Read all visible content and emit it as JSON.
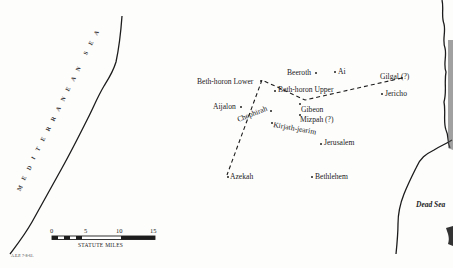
{
  "map": {
    "sea_label": "MEDITERRANEAN SEA",
    "dead_sea_label": "Dead Sea",
    "credit": "A.E.P. 7-8-61.",
    "places": [
      {
        "id": "beeroth",
        "name": "Beeroth"
      },
      {
        "id": "ai",
        "name": "Ai"
      },
      {
        "id": "beth-horon-lower",
        "name": "Beth-horon Lower"
      },
      {
        "id": "beth-horon-upper",
        "name": "Beth-horon Upper"
      },
      {
        "id": "gilgal",
        "name": "Gilgal (?)"
      },
      {
        "id": "jericho",
        "name": "Jericho"
      },
      {
        "id": "aijalon",
        "name": "Aijalon"
      },
      {
        "id": "chephirah",
        "name": "Chephirah"
      },
      {
        "id": "gibeon",
        "name": "Gibeon"
      },
      {
        "id": "mizpah",
        "name": "Mizpah (?)"
      },
      {
        "id": "kirjath-jearim",
        "name": "Kirjath-jearim"
      },
      {
        "id": "jerusalem",
        "name": "Jerusalem"
      },
      {
        "id": "azekah",
        "name": "Azekah"
      },
      {
        "id": "bethlehem",
        "name": "Bethlehem"
      }
    ],
    "route": [
      "Gilgal (?)",
      "Gibeon",
      "Beth-horon Upper",
      "Beth-horon Lower",
      "Azekah"
    ],
    "scale": {
      "ticks": [
        "0",
        "5",
        "10",
        "15"
      ],
      "caption": "STATUTE MILES"
    }
  }
}
